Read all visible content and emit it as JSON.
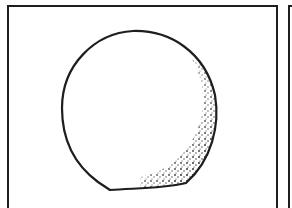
{
  "illustration": {
    "subject": "hand-drawn sphere with stippled shading",
    "ink_color": "#1e1e1e",
    "paper_color": "#ffffff",
    "shading_side": "lower-right"
  }
}
